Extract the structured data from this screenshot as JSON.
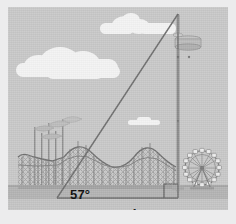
{
  "figure": {
    "kind": "trigonometry-illustration",
    "scene_description": "amusement park skyline with right triangle to observation tower",
    "labels": {
      "angle": "57°",
      "base_distance": "50 yd"
    },
    "geometry": {
      "angle_of_elevation_deg": 57,
      "base_length": 50,
      "base_unit": "yd",
      "right_angle_marked": true,
      "vertex_observer": [
        49,
        191
      ],
      "vertex_tower_top": [
        170,
        7
      ],
      "vertex_tower_base": [
        170,
        191
      ]
    },
    "colors": {
      "sky": "#c9c9c9",
      "cloud": "#f4f4f4",
      "ground": "#b4b4b4",
      "foreground": "#c5c5c5",
      "line": "#6b6b6b",
      "structure": "#8a8a8a",
      "text": "#0d0d0d",
      "frame": "#ececed"
    },
    "elements": {
      "clouds": [
        {
          "name": "cloud-upper-right",
          "x": 92,
          "y": 10,
          "w": 74,
          "h": 16
        },
        {
          "name": "cloud-large-left",
          "x": 10,
          "y": 44,
          "w": 104,
          "h": 26
        },
        {
          "name": "cloud-small-mid",
          "x": 122,
          "y": 112,
          "w": 28,
          "h": 5
        }
      ],
      "rides": [
        {
          "name": "roller-coaster",
          "label": "roller coaster"
        },
        {
          "name": "ferris-wheel",
          "label": "ferris wheel"
        },
        {
          "name": "observation-tower",
          "label": "observation tower"
        },
        {
          "name": "flag-poles",
          "label": "flag poles"
        }
      ]
    }
  }
}
